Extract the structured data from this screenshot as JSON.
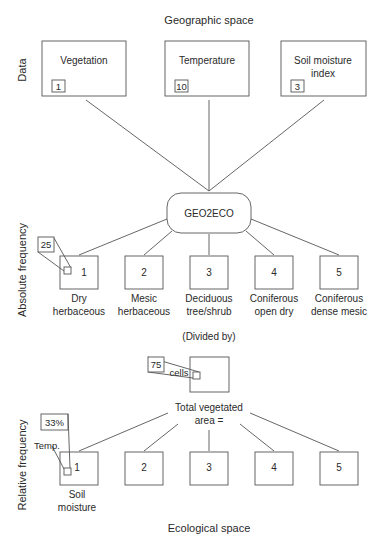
{
  "titles": {
    "top": "Geographic space",
    "bottom": "Ecological space"
  },
  "axis_labels": {
    "data": "Data",
    "absolute": "Absolute frequency",
    "relative": "Relative frequency"
  },
  "data_layers": [
    {
      "name_line1": "Vegetation",
      "name_line2": "",
      "value": "1"
    },
    {
      "name_line1": "Temperature",
      "name_line2": "",
      "value": "10"
    },
    {
      "name_line1": "Soil moisture",
      "name_line2": "index",
      "value": "3"
    }
  ],
  "process": {
    "label": "GEO2ECO"
  },
  "absolute": {
    "callout_value": "25",
    "classes": [
      {
        "number": "1",
        "line1": "Dry",
        "line2": "herbaceous"
      },
      {
        "number": "2",
        "line1": "Mesic",
        "line2": "herbaceous"
      },
      {
        "number": "3",
        "line1": "Deciduous",
        "line2": "tree/shrub"
      },
      {
        "number": "4",
        "line1": "Coniferous",
        "line2": "open dry"
      },
      {
        "number": "5",
        "line1": "Coniferous",
        "line2": "dense mesic"
      }
    ]
  },
  "divided_by": "(Divided by)",
  "total": {
    "callout_value": "75",
    "callout_unit": "cells",
    "line1": "Total vegetated",
    "line2": "area ="
  },
  "relative": {
    "callout_value": "33%",
    "callout_label": "Temp.",
    "classes": [
      {
        "number": "1"
      },
      {
        "number": "2"
      },
      {
        "number": "3"
      },
      {
        "number": "4"
      },
      {
        "number": "5"
      }
    ],
    "axis_line1": "Soil",
    "axis_line2": "moisture"
  }
}
